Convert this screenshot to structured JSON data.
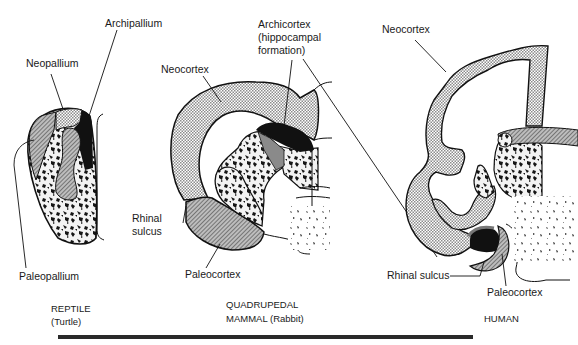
{
  "figure": {
    "panels": [
      {
        "id": "reptile",
        "caption_line1": "REPTILE",
        "caption_line2": "(Turtle)",
        "labels": {
          "archipallium": "Archipallium",
          "neopallium": "Neopallium",
          "paleopallium": "Paleopallium"
        }
      },
      {
        "id": "rabbit",
        "caption_line1": "QUADRUPEDAL",
        "caption_line2": "MAMMAL (Rabbit)",
        "labels": {
          "archicortex_1": "Archicortex",
          "archicortex_2": "(hippocampal",
          "archicortex_3": "formation)",
          "neocortex": "Neocortex",
          "rhinal_1": "Rhinal",
          "rhinal_2": "sulcus",
          "paleocortex": "Paleocortex"
        }
      },
      {
        "id": "human",
        "caption_line1": "HUMAN",
        "labels": {
          "neocortex": "Neocortex",
          "rhinal_sulcus": "Rhinal sulcus",
          "paleocortex": "Paleocortex"
        }
      }
    ],
    "colors": {
      "ink": "#1a1a1a",
      "stipple_light": "#d8d8d8",
      "hatch_mid": "#9a9a9a",
      "dark": "#111111"
    }
  }
}
